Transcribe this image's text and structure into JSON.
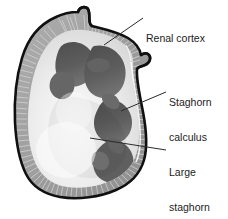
{
  "figure": {
    "background_color": "#ffffff",
    "width": 228,
    "height": 219
  },
  "labels": [
    {
      "id": "renal-cortex",
      "text": "Renal cortex",
      "lines": [
        "Renal cortex"
      ],
      "color": "#1c1c1c"
    },
    {
      "id": "staghorn-calculus",
      "text": "Staghorn calculus",
      "lines": [
        "Staghorn",
        "calculus"
      ],
      "color": "#1c1c1c"
    },
    {
      "id": "large-staghorn-calculus",
      "text": "Large staghorn calculus resembles deer antler",
      "lines": [
        "Large",
        "staghorn",
        "calculus",
        "resembles",
        "deer antler"
      ],
      "color": "#1c1c1c"
    }
  ],
  "anatomy": {
    "outline_color": "#111111",
    "cortex_fill": "#a3a3a3",
    "cortex_striation_color": "#d8d8d8",
    "medulla_fill": "#ececec",
    "calculus_fill": "#5a5a5a",
    "calculus_shadow": "#6e6e6e",
    "highlight_fill": "#f7f7f7",
    "parts": [
      {
        "name": "renal-capsule-outline",
        "description": "outer kidney border"
      },
      {
        "name": "renal-cortex-band",
        "description": "striated outer gray band"
      },
      {
        "name": "renal-medulla",
        "description": "pale inner parenchyma"
      },
      {
        "name": "staghorn-calculus",
        "description": "dark branching stone filling calyces"
      },
      {
        "name": "ureter-stub",
        "description": "small protrusion at top"
      },
      {
        "name": "hilum-notch",
        "description": "small bump on right margin"
      }
    ]
  },
  "leader_lines": [
    {
      "name": "leader-renal-cortex",
      "from": [
        143,
        18
      ],
      "to": [
        104,
        45
      ]
    },
    {
      "name": "leader-staghorn-calculus",
      "from": [
        166,
        92
      ],
      "to": [
        121,
        111
      ]
    },
    {
      "name": "leader-large-staghorn",
      "from": [
        166,
        150
      ],
      "to": [
        90,
        138
      ]
    }
  ]
}
